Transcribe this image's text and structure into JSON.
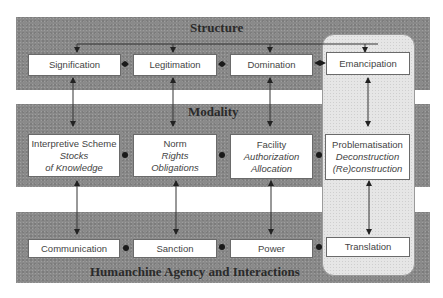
{
  "bands": {
    "structure": {
      "title": "Structure"
    },
    "modality": {
      "title": "Modality"
    },
    "agency": {
      "title": "Humanchine Agency and Interactions"
    }
  },
  "structure": {
    "signification": "Signification",
    "legitimation": "Legitimation",
    "domination": "Domination",
    "emancipation": "Emancipation"
  },
  "modality": {
    "interpretive": {
      "title": "Interpretive Scheme",
      "line1": "Stocks",
      "line2": "of Knowledge"
    },
    "norm": {
      "title": "Norm",
      "line1": "Rights",
      "line2": "Obligations"
    },
    "facility": {
      "title": "Facility",
      "line1": "Authorization",
      "line2": "Allocation"
    },
    "problematisation": {
      "title": "Problematisation",
      "line1": "Deconstruction",
      "line2": "(Re)construction"
    }
  },
  "agency": {
    "communication": "Communication",
    "sanction": "Sanction",
    "power": "Power",
    "translation": "Translation"
  },
  "colors": {
    "band": "#8a8a8a",
    "panel": "#e6e6e6",
    "box": "#ffffff",
    "line": "#333333"
  }
}
